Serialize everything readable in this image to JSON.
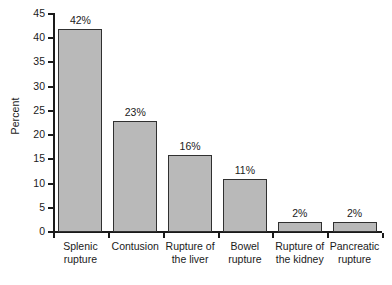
{
  "chart_data": {
    "type": "bar",
    "title": "",
    "subtitle": "",
    "xlabel": "",
    "ylabel": "Percent",
    "ylim": [
      0,
      45
    ],
    "ytick_step": 5,
    "yticks": [
      45,
      40,
      35,
      30,
      25,
      20,
      15,
      10,
      5,
      0
    ],
    "ytick_labels": [
      "45",
      "40",
      "35",
      "30",
      "25",
      "20",
      "15",
      "10",
      "5",
      "0"
    ],
    "grid": false,
    "legend": false,
    "legend_position": "none",
    "orientation": "vertical",
    "bar_fill_color": "#b9b9b9",
    "bar_edge_color": "#303030",
    "axis_color": "#1a1a1a",
    "background_color": "#ffffff",
    "categories": [
      "Splenic rupture",
      "Contusion",
      "Rupture of the liver",
      "Bowel rupture",
      "Rupture of the kidney",
      "Pancreatic rupture"
    ],
    "category_lines": [
      [
        "Splenic",
        "rupture"
      ],
      [
        "Contusion",
        ""
      ],
      [
        "Rupture of",
        "the liver"
      ],
      [
        "Bowel",
        "rupture"
      ],
      [
        "Rupture of",
        "the kidney"
      ],
      [
        "Pancreatic",
        "rupture"
      ]
    ],
    "values": [
      42,
      23,
      16,
      11,
      2,
      2
    ],
    "data_labels": [
      "42%",
      "23%",
      "16%",
      "11%",
      "2%",
      "2%"
    ]
  }
}
